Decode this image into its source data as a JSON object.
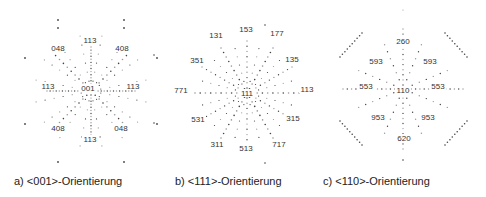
{
  "figure": {
    "panels": [
      {
        "id": "a",
        "caption": "a) <001>-Orientierung",
        "center_label": "001",
        "labels": [
          {
            "text": "113",
            "x": 90,
            "y": 43
          },
          {
            "text": "048",
            "x": 58,
            "y": 51
          },
          {
            "text": "408",
            "x": 122,
            "y": 51
          },
          {
            "text": "113",
            "x": 48,
            "y": 89
          },
          {
            "text": "001",
            "x": 88,
            "y": 91
          },
          {
            "text": "113",
            "x": 133,
            "y": 89
          },
          {
            "text": "408",
            "x": 58,
            "y": 131
          },
          {
            "text": "048",
            "x": 121,
            "y": 131
          },
          {
            "text": "113",
            "x": 90,
            "y": 142
          }
        ]
      },
      {
        "id": "b",
        "caption": "b) <111>-Orientierung",
        "center_label": "111",
        "labels": [
          {
            "text": "131",
            "x": 216,
            "y": 38
          },
          {
            "text": "153",
            "x": 246,
            "y": 32
          },
          {
            "text": "177",
            "x": 277,
            "y": 36
          },
          {
            "text": "351",
            "x": 197,
            "y": 63
          },
          {
            "text": "135",
            "x": 292,
            "y": 62
          },
          {
            "text": "771",
            "x": 181,
            "y": 93
          },
          {
            "text": "111",
            "x": 247,
            "y": 96
          },
          {
            "text": "113",
            "x": 307,
            "y": 92
          },
          {
            "text": "531",
            "x": 198,
            "y": 122
          },
          {
            "text": "315",
            "x": 293,
            "y": 121
          },
          {
            "text": "311",
            "x": 217,
            "y": 147
          },
          {
            "text": "513",
            "x": 246,
            "y": 151
          },
          {
            "text": "717",
            "x": 279,
            "y": 147
          }
        ]
      },
      {
        "id": "c",
        "caption": "c) <110>-Orientierung",
        "center_label": "110",
        "labels": [
          {
            "text": "260",
            "x": 403,
            "y": 44
          },
          {
            "text": "593",
            "x": 376,
            "y": 64
          },
          {
            "text": "593",
            "x": 430,
            "y": 64
          },
          {
            "text": "553",
            "x": 366,
            "y": 89
          },
          {
            "text": "110",
            "x": 403,
            "y": 93
          },
          {
            "text": "553",
            "x": 438,
            "y": 89
          },
          {
            "text": "953",
            "x": 378,
            "y": 120
          },
          {
            "text": "953",
            "x": 428,
            "y": 120
          },
          {
            "text": "620",
            "x": 404,
            "y": 141
          }
        ]
      }
    ]
  }
}
